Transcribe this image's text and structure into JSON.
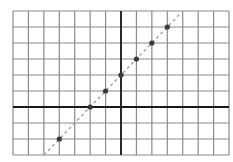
{
  "chart_data": {
    "type": "scatter",
    "title": "",
    "xlabel": "",
    "ylabel": "",
    "xlim": [
      -7,
      7
    ],
    "ylim": [
      -3,
      6
    ],
    "grid": true,
    "grid_step": 1,
    "tick_labels": false,
    "legend": null,
    "series": [
      {
        "name": "points",
        "marker": "circle",
        "x": [
          -4,
          -2,
          -1,
          0,
          1,
          2,
          3
        ],
        "y": [
          -2,
          0,
          1,
          2,
          3,
          4,
          5
        ]
      },
      {
        "name": "line y = x + 2",
        "style": "dashed",
        "x": [
          -5,
          3.9
        ],
        "y": [
          -3,
          5.9
        ]
      }
    ]
  },
  "colors": {
    "background": "#ffffff",
    "grid": "#8a8a8a",
    "axis": "#1a1a1a",
    "point": "#3a3a3a",
    "line": "#9a9a9a"
  },
  "layout": {
    "left": 13,
    "top": 11,
    "right": 229,
    "bottom": 155
  }
}
